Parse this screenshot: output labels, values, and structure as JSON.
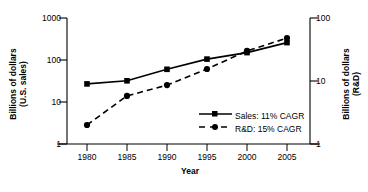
{
  "chart_data": {
    "type": "line",
    "title": "",
    "xlabel": "Year",
    "ylabel": "Billions of dollars (U.S. sales)",
    "ylabel_line1": "Billions of dollars",
    "ylabel_line2": "(U.S. sales)",
    "ylabel_right": "Billions of dollars (R&D)",
    "ylabel_right_line1": "Billions of dollars",
    "ylabel_right_line2": "(R&D)",
    "x": [
      1980,
      1985,
      1990,
      1995,
      2000,
      2005
    ],
    "xtick_labels": [
      "1980",
      "1985",
      "1990",
      "1995",
      "2000",
      "2005"
    ],
    "xlim": [
      1977.5,
      2007.5
    ],
    "yscale": "log",
    "ylim": [
      1,
      1000
    ],
    "ytick_labels": [
      "1000",
      "100",
      "10",
      "1"
    ],
    "ytick_values": [
      1000,
      100,
      10,
      1
    ],
    "ylim_right": [
      1,
      100
    ],
    "ytick_labels_right": [
      "100",
      "10",
      "1"
    ],
    "ytick_values_right": [
      100,
      10,
      1
    ],
    "grid": false,
    "legend_position": "lower right",
    "series": [
      {
        "name": "Sales: 11% CAGR",
        "short_name": "Sales",
        "cagr": "11%",
        "axis": "left",
        "linestyle": "solid",
        "marker": "square",
        "color": "#000000",
        "values": [
          27,
          32,
          60,
          105,
          150,
          260
        ]
      },
      {
        "name": "R&D:  15% CAGR",
        "short_name": "R&D",
        "cagr": "15%",
        "axis": "right",
        "linestyle": "dashed",
        "marker": "circle",
        "color": "#000000",
        "values": [
          2.0,
          5.8,
          8.6,
          15.5,
          30,
          48
        ]
      }
    ]
  },
  "legend": {
    "items": [
      {
        "label": "Sales:  11% CAGR"
      },
      {
        "label": "R&D:   15% CAGR"
      }
    ]
  },
  "colors": {
    "axis": "#000000",
    "series1": "#000000",
    "series2": "#000000",
    "background": "#ffffff"
  }
}
